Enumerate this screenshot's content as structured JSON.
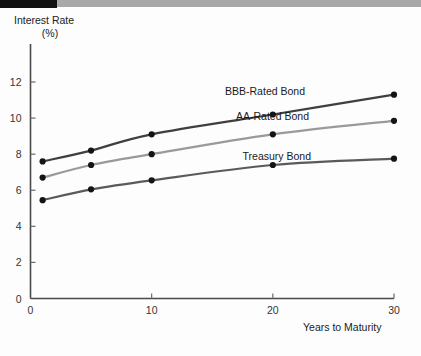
{
  "figure": {
    "name": "bond-yield-curve-figure",
    "background": "#fdfdfd",
    "banner": {
      "black_color": "#111111",
      "gray_color": "#a8a8a8"
    }
  },
  "axis": {
    "y_title_line1": "Interest Rate",
    "y_title_line2": "(%)",
    "x_title": "Years to Maturity",
    "y_ticks": [
      "0",
      "2",
      "4",
      "6",
      "8",
      "10",
      "12"
    ],
    "x_ticks": [
      "0",
      "10",
      "20",
      "30"
    ]
  },
  "chart_data": {
    "type": "line",
    "title": "",
    "xlabel": "Years to Maturity",
    "ylabel": "Interest Rate (%)",
    "xlim": [
      0,
      30
    ],
    "ylim": [
      0,
      13
    ],
    "xticks": [
      0,
      10,
      20,
      30
    ],
    "yticks": [
      0,
      2,
      4,
      6,
      8,
      10,
      12
    ],
    "grid": false,
    "legend": "inline-labels",
    "x": [
      1,
      5,
      10,
      20,
      30
    ],
    "series": [
      {
        "name": "BBB-Rated Bond",
        "label": "BBB-Rated Bond",
        "color": "#3f3f3f",
        "values": [
          7.6,
          8.2,
          9.1,
          10.2,
          11.3
        ],
        "label_x": 305,
        "label_y": 95
      },
      {
        "name": "AA-Rated Bond",
        "label": "AA-Rated Bond",
        "color": "#9a9a9a",
        "values": [
          6.7,
          7.4,
          8.0,
          9.1,
          9.85
        ],
        "label_x": 309,
        "label_y": 120
      },
      {
        "name": "Treasury Bond",
        "label": "Treasury Bond",
        "color": "#5a5a5a",
        "values": [
          5.45,
          6.05,
          6.55,
          7.4,
          7.75
        ],
        "label_x": 311,
        "label_y": 160
      }
    ]
  }
}
